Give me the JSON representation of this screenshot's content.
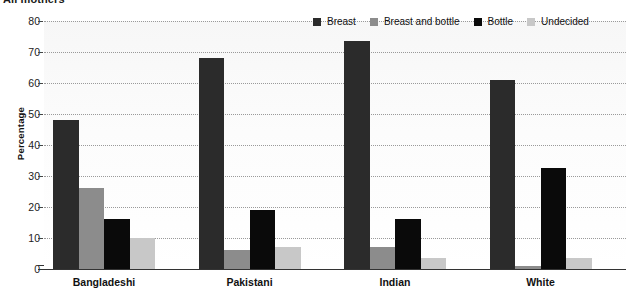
{
  "chart_data": {
    "type": "bar",
    "title": "All mothers",
    "xlabel": "",
    "ylabel": "Percentage",
    "ylim": [
      0,
      80
    ],
    "yticks": [
      0,
      10,
      20,
      30,
      40,
      50,
      60,
      70,
      80
    ],
    "ytick_labels": [
      "0",
      "10",
      "20",
      "30",
      "40",
      "50",
      "60",
      "70",
      "80"
    ],
    "grid": true,
    "legend_position": "top-right",
    "categories": [
      "Bangladeshi",
      "Pakistani",
      "Indian",
      "White"
    ],
    "series": [
      {
        "name": "Breast",
        "color": "#2b2b2b",
        "values": [
          48,
          68,
          73.5,
          61
        ]
      },
      {
        "name": "Breast and bottle",
        "color": "#8c8c8c",
        "values": [
          26,
          6,
          7,
          1
        ]
      },
      {
        "name": "Bottle",
        "color": "#0a0a0a",
        "values": [
          16,
          19,
          16,
          32.5
        ]
      },
      {
        "name": "Undecided",
        "color": "#c8c8c8",
        "values": [
          10,
          7,
          3.5,
          3.5
        ]
      }
    ]
  },
  "colors": {
    "plot_background": "#fbfbfb",
    "gridline": "#9a9a9a",
    "axis": "#333333",
    "text": "#111111"
  }
}
